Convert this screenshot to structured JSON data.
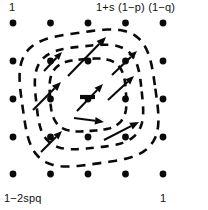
{
  "figure": {
    "type": "adaptive-landscape",
    "width": 208,
    "height": 210,
    "background_color": "#ffffff",
    "ink_color": "#0a0a0a"
  },
  "labels": {
    "top_left": "1",
    "top_right": "1+s (1−p) (1−q)",
    "bottom_left": "1−2spq",
    "bottom_right": "1"
  },
  "chart_data": {
    "type": "diagram",
    "title": "",
    "grid": {
      "rows": 5,
      "cols": 5,
      "dot_radius": 3.4,
      "x_positions": [
        13,
        50.5,
        88,
        125.5,
        163
      ],
      "y_positions": [
        23,
        61,
        99,
        137,
        174
      ]
    },
    "contours": {
      "count": 3,
      "style": "dashed",
      "shape": "rounded-square",
      "rings": [
        {
          "name": "outer",
          "cx": 89,
          "cy": 98,
          "rx": 67,
          "ry": 66,
          "squareness": 0.62,
          "rotation": -8,
          "dash": "9 7"
        },
        {
          "name": "middle",
          "cx": 89,
          "cy": 97,
          "rx": 53,
          "ry": 51,
          "squareness": 0.58,
          "rotation": -6,
          "dash": "8 7"
        },
        {
          "name": "inner",
          "cx": 88,
          "cy": 95,
          "rx": 38,
          "ry": 36,
          "squareness": 0.52,
          "rotation": -4,
          "dash": "8 6"
        }
      ]
    },
    "saddle_marker": {
      "shape": "short-horizontal-bar",
      "x1": 80,
      "y1": 97,
      "x2": 95,
      "y2": 97
    },
    "arrows": {
      "direction": "northeast",
      "count": 9,
      "items": [
        {
          "id": "a1",
          "x1": 68,
          "y1": 76,
          "x2": 106,
          "y2": 37,
          "head": 9.5
        },
        {
          "id": "a2",
          "x1": 44,
          "y1": 71,
          "x2": 62,
          "y2": 52,
          "head": 8.0
        },
        {
          "id": "a3",
          "x1": 33,
          "y1": 110,
          "x2": 61,
          "y2": 82,
          "head": 9.0
        },
        {
          "id": "a4",
          "x1": 41,
          "y1": 152,
          "x2": 62,
          "y2": 131,
          "head": 8.5
        },
        {
          "id": "a5",
          "x1": 74,
          "y1": 118,
          "x2": 104,
          "y2": 122,
          "head": 9.0
        },
        {
          "id": "a6",
          "x1": 77,
          "y1": 111,
          "x2": 103,
          "y2": 84,
          "head": 8.5
        },
        {
          "id": "a7",
          "x1": 108,
          "y1": 100,
          "x2": 134,
          "y2": 76,
          "head": 8.5
        },
        {
          "id": "a8",
          "x1": 112,
          "y1": 75,
          "x2": 137,
          "y2": 51,
          "head": 8.5
        },
        {
          "id": "a9",
          "x1": 104,
          "y1": 140,
          "x2": 139,
          "y2": 122,
          "head": 9.0
        }
      ]
    },
    "corner_annotations": [
      {
        "position": "top-left",
        "text": "1"
      },
      {
        "position": "top-right",
        "text": "1+s (1−p) (1−q)"
      },
      {
        "position": "bottom-left",
        "text": "1−2spq"
      },
      {
        "position": "bottom-right",
        "text": "1"
      }
    ]
  }
}
